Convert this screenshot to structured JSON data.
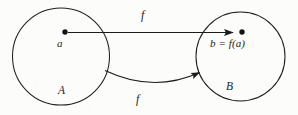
{
  "diagram": {
    "type": "function-mapping-diagram",
    "background_color": "#fcfcfb",
    "stroke_color": "#1b1b1b",
    "sets": [
      {
        "id": "set-a",
        "label": "A",
        "shape": "circle",
        "cx": 61,
        "cy": 56.5,
        "r": 48.5,
        "label_x": 58,
        "label_y": 85
      },
      {
        "id": "set-b",
        "label": "B",
        "shape": "circle",
        "cx": 240.5,
        "cy": 56.5,
        "r": 44.5,
        "label_x": 226,
        "label_y": 81
      }
    ],
    "points": [
      {
        "id": "point-a",
        "label": "a",
        "cx": 65,
        "cy": 32,
        "r": 2.6,
        "label_x": 57,
        "label_y": 38
      },
      {
        "id": "point-b",
        "label": "b = f(a)",
        "cx": 242,
        "cy": 32,
        "r": 2.6,
        "label_x": 210,
        "label_y": 38
      }
    ],
    "arrows": [
      {
        "id": "arrow-straight",
        "label": "f",
        "style": "straight",
        "from_x": 68,
        "from_y": 32.5,
        "to_x": 234,
        "to_y": 32.5,
        "label_x": 141,
        "label_y": 9
      },
      {
        "id": "arrow-curved",
        "label": "f",
        "style": "curved",
        "from_x": 105,
        "from_y": 71,
        "to_x": 200,
        "to_y": 73,
        "control_x": 152,
        "control_y": 92,
        "label_x": 136,
        "label_y": 93
      }
    ]
  }
}
